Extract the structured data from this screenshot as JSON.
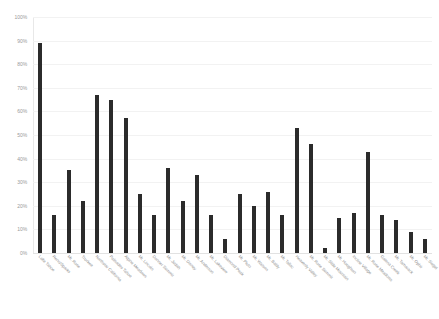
{
  "chart_data": {
    "type": "bar",
    "title": "",
    "xlabel": "",
    "ylabel": "",
    "ylim": [
      0,
      100
    ],
    "grid": true,
    "legend": false,
    "bar_color": "#2b2b2b",
    "y_ticks": [
      "0%",
      "10%",
      "20%",
      "30%",
      "40%",
      "50%",
      "60%",
      "70%",
      "80%",
      "90%",
      "100%"
    ],
    "y_tick_values": [
      0,
      10,
      20,
      30,
      40,
      50,
      60,
      70,
      80,
      90,
      100
    ],
    "categories": [
      "Lake Tahoe",
      "Reno/Sparks",
      "Mt. Rose",
      "Truckee",
      "Northstar California",
      "Palisades Tahoe",
      "Alpine Meadows",
      "Mt. Lincoln",
      "Donner Summit",
      "Mt. Judah",
      "Mt. Disney",
      "Mt. Anderson",
      "Mt. Lakeview",
      "Diamond Peak",
      "Mt. Pluto",
      "Mt. Watson",
      "Mt. Baldy",
      "Mt. Tallac",
      "Heavenly Valley",
      "Mt. Rose Summit",
      "Mt. Slide Mountain",
      "Mt. Houghton",
      "Incline Village",
      "Mt. Rose Meadows",
      "Galena Creek",
      "Mt. Tamarack",
      "Mt. Ophir",
      "Mt. Siegel"
    ],
    "values": [
      89,
      16,
      35,
      22,
      67,
      65,
      57,
      25,
      16,
      36,
      22,
      33,
      16,
      6,
      25,
      20,
      26,
      16,
      53,
      46,
      2,
      15,
      17,
      43,
      16,
      14,
      9,
      6
    ]
  }
}
